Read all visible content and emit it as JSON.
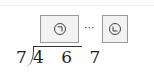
{
  "problem": {
    "divisor": "7",
    "dividend": "4 6 7",
    "quotient_box": {
      "label": "㉠",
      "icon": "circled-giyeok"
    },
    "separator": "···",
    "remainder_box": {
      "label": "㉡",
      "icon": "circled-nieun"
    }
  },
  "colors": {
    "box_border": "#9a9a9a",
    "box_fill": "#f2f2f2",
    "ink": "#222222"
  }
}
